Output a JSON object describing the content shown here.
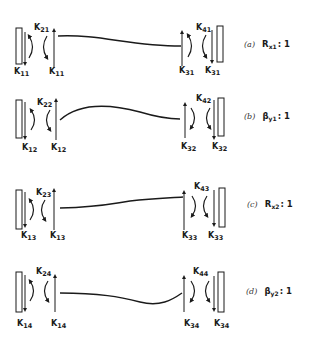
{
  "figure": {
    "panels": [
      {
        "id": "a",
        "caption_letter": "(a)",
        "caption_symbol": "R",
        "caption_sub": "x1",
        "caption_ratio": ": 1",
        "left_top_label": "K",
        "left_top_sub": "21",
        "left_bottom_outer": "K",
        "left_bottom_outer_sub": "11",
        "left_bottom_inner": "K",
        "left_bottom_inner_sub": "11",
        "right_top_label": "K",
        "right_top_sub": "41",
        "right_bottom_inner": "K",
        "right_bottom_inner_sub": "31",
        "right_bottom_outer": "K",
        "right_bottom_outer_sub": "31"
      },
      {
        "id": "b",
        "caption_letter": "(b)",
        "caption_symbol": "β",
        "caption_sub": "y1",
        "caption_ratio": ": 1",
        "left_top_label": "K",
        "left_top_sub": "22",
        "left_bottom_outer": "K",
        "left_bottom_outer_sub": "12",
        "left_bottom_inner": "K",
        "left_bottom_inner_sub": "12",
        "right_top_label": "K",
        "right_top_sub": "42",
        "right_bottom_inner": "K",
        "right_bottom_inner_sub": "32",
        "right_bottom_outer": "K",
        "right_bottom_outer_sub": "32"
      },
      {
        "id": "c",
        "caption_letter": "(c)",
        "caption_symbol": "R",
        "caption_sub": "x2",
        "caption_ratio": ": 1",
        "left_top_label": "K",
        "left_top_sub": "23",
        "left_bottom_outer": "K",
        "left_bottom_outer_sub": "13",
        "left_bottom_inner": "K",
        "left_bottom_inner_sub": "13",
        "right_top_label": "K",
        "right_top_sub": "43",
        "right_bottom_inner": "K",
        "right_bottom_inner_sub": "33",
        "right_bottom_outer": "K",
        "right_bottom_outer_sub": "33"
      },
      {
        "id": "d",
        "caption_letter": "(d)",
        "caption_symbol": "β",
        "caption_sub": "y2",
        "caption_ratio": ": 1",
        "left_top_label": "K",
        "left_top_sub": "24",
        "left_bottom_outer": "K",
        "left_bottom_outer_sub": "14",
        "left_bottom_inner": "K",
        "left_bottom_inner_sub": "14",
        "right_top_label": "K",
        "right_top_sub": "44",
        "right_bottom_inner": "K",
        "right_bottom_inner_sub": "34",
        "right_bottom_outer": "K",
        "right_bottom_outer_sub": "34"
      }
    ],
    "colors": {
      "ink": "#1a1a1a",
      "background": "#ffffff"
    }
  }
}
